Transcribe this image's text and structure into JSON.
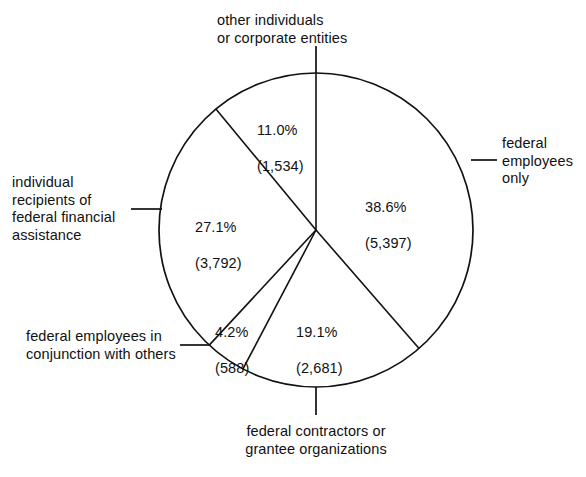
{
  "chart_data": {
    "type": "pie",
    "title": "",
    "subtitle": "",
    "xlabel": "",
    "ylabel": "",
    "legend_position": "callout-labels",
    "grid": false,
    "value_label_format": "percent_and_count",
    "start_angle_deg": 0,
    "direction": "clockwise",
    "total": 13992,
    "categories": [
      "federal employees only",
      "federal contractors or grantee organizations",
      "federal employees in conjunction with others",
      "individual recipients of federal financial assistance",
      "other individuals or corporate entities"
    ],
    "values": [
      5397,
      2681,
      588,
      3792,
      1534
    ],
    "percents": [
      38.6,
      19.1,
      4.2,
      27.1,
      11.0
    ],
    "slices": [
      {
        "key": "federal-employees-only",
        "label": "federal\nemployees\nonly",
        "percent_text": "38.6%",
        "count_text": "(5,397)",
        "percent": 38.6,
        "value": 5397,
        "start_deg": 0,
        "end_deg": 138.96
      },
      {
        "key": "federal-contractors",
        "label": "federal contractors or\ngrantee organizations",
        "percent_text": "19.1%",
        "count_text": "(2,681)",
        "percent": 19.1,
        "value": 2681,
        "start_deg": 138.96,
        "end_deg": 207.72
      },
      {
        "key": "federal-employees-conjunction",
        "label": "federal employees in\nconjunction with others",
        "percent_text": "4.2%",
        "count_text": "(588)",
        "percent": 4.2,
        "value": 588,
        "start_deg": 207.72,
        "end_deg": 222.84
      },
      {
        "key": "individual-recipients",
        "label": "individual\nrecipients of\nfederal financial\nassistance",
        "percent_text": "27.1%",
        "count_text": "(3,792)",
        "percent": 27.1,
        "value": 3792,
        "start_deg": 222.84,
        "end_deg": 320.4
      },
      {
        "key": "other-individuals",
        "label": "other individuals\nor corporate entities",
        "percent_text": "11.0%",
        "count_text": "(1,534)",
        "percent": 11.0,
        "value": 1534,
        "start_deg": 320.4,
        "end_deg": 360
      }
    ],
    "style": {
      "stroke": "#111111",
      "fill": "#ffffff",
      "stroke_width": 1.6,
      "background": "#ffffff"
    }
  },
  "callouts": {
    "other_individuals": "other individuals\nor corporate entities",
    "federal_employees_only": "federal\nemployees\nonly",
    "individual_recipients": "individual\nrecipients of\nfederal financial\nassistance",
    "federal_employees_conjunction": "federal employees in\nconjunction with others",
    "federal_contractors": "federal contractors or\ngrantee organizations"
  },
  "values_inside": {
    "other_individuals_pct": "11.0%",
    "other_individuals_count": "(1,534)",
    "federal_employees_only_pct": "38.6%",
    "federal_employees_only_count": "(5,397)",
    "individual_recipients_pct": "27.1%",
    "individual_recipients_count": "(3,792)",
    "federal_employees_conjunction_pct": "4.2%",
    "federal_employees_conjunction_count": "(588)",
    "federal_contractors_pct": "19.1%",
    "federal_contractors_count": "(2,681)"
  }
}
